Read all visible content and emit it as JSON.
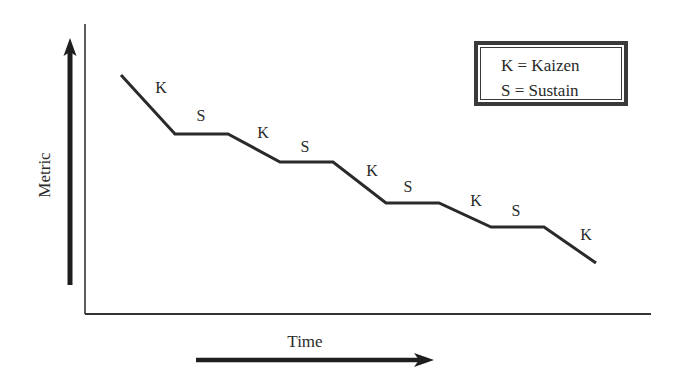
{
  "diagram": {
    "type": "step-down process diagram",
    "legend": {
      "entries": [
        {
          "key": "K",
          "label": "K = Kaizen"
        },
        {
          "key": "S",
          "label": "S = Sustain"
        }
      ]
    },
    "axes": {
      "y_label": "Metric",
      "x_label": "Time",
      "y_arrow_direction": "up",
      "x_arrow_direction": "right"
    },
    "path_points": [
      [
        121,
        75
      ],
      [
        175,
        134
      ],
      [
        228,
        134
      ],
      [
        280,
        162
      ],
      [
        333,
        162
      ],
      [
        386,
        203
      ],
      [
        439,
        203
      ],
      [
        491,
        227
      ],
      [
        544,
        227
      ],
      [
        596,
        263
      ]
    ],
    "phases": [
      {
        "label": "K",
        "x": 161,
        "y": 88
      },
      {
        "label": "S",
        "x": 201,
        "y": 116
      },
      {
        "label": "K",
        "x": 263,
        "y": 133
      },
      {
        "label": "S",
        "x": 305,
        "y": 147
      },
      {
        "label": "K",
        "x": 372,
        "y": 171
      },
      {
        "label": "S",
        "x": 408,
        "y": 187
      },
      {
        "label": "K",
        "x": 476,
        "y": 201
      },
      {
        "label": "S",
        "x": 516,
        "y": 211
      },
      {
        "label": "K",
        "x": 586,
        "y": 235
      }
    ],
    "colors": {
      "line": "#2a2a2a",
      "axis": "#333333",
      "background": "#ffffff"
    }
  }
}
